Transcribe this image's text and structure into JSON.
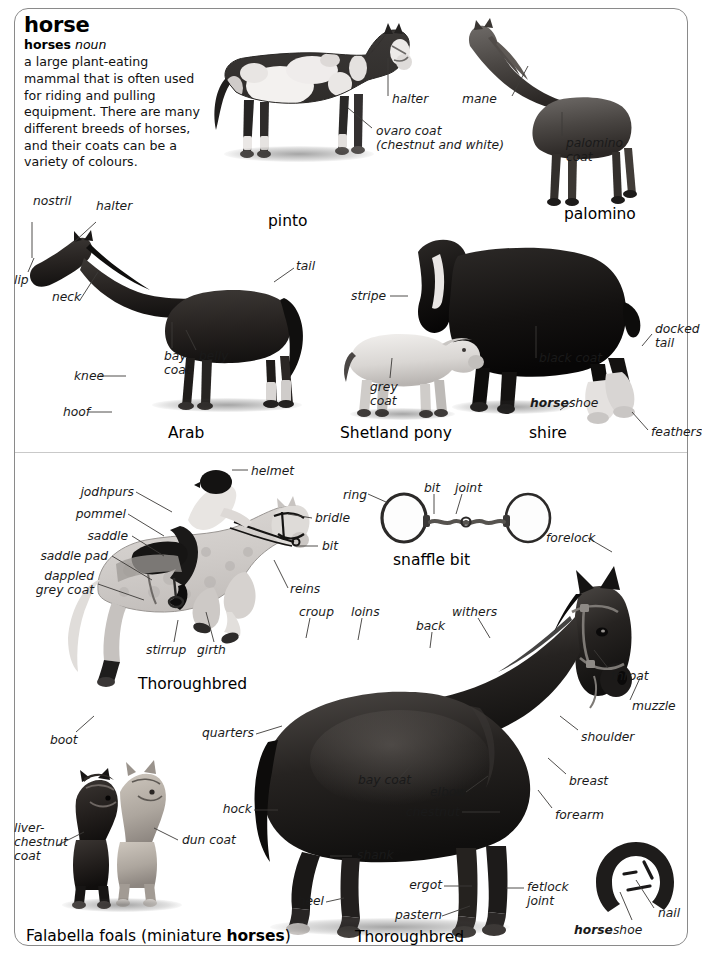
{
  "page": {
    "width": 702,
    "height": 964,
    "background": "#ffffff",
    "frame_color": "#8a8a8a"
  },
  "entry": {
    "headword": "horse",
    "inflection": "horses",
    "part_of_speech": "noun",
    "definition": "a large plant-eating mammal that is often used for riding and pulling equipment. There are many different breeds of horses, and their coats can be a variety of colours."
  },
  "captions": [
    {
      "id": "pinto",
      "text": "pinto"
    },
    {
      "id": "palomino",
      "text": "palomino"
    },
    {
      "id": "arab",
      "text": "Arab"
    },
    {
      "id": "shetland",
      "text": "Shetland pony"
    },
    {
      "id": "shire",
      "text": "shire"
    },
    {
      "id": "thoroughbred-1",
      "text": "Thoroughbred"
    },
    {
      "id": "snaffle-bit",
      "text": "snaffle bit"
    },
    {
      "id": "thoroughbred-2",
      "text": "Thoroughbred"
    },
    {
      "id": "falabella",
      "text": "Falabella foals (miniature horses)"
    }
  ],
  "labels": {
    "pinto": [
      {
        "id": "halter",
        "text": "halter"
      },
      {
        "id": "ovaro-coat",
        "text": "ovaro coat\n(chestnut and white)"
      }
    ],
    "palomino": [
      {
        "id": "mane",
        "text": "mane"
      },
      {
        "id": "palomino-coat",
        "text": "palomino\ncoat"
      }
    ],
    "arab": [
      {
        "id": "nostril",
        "text": "nostril"
      },
      {
        "id": "halter",
        "text": "halter"
      },
      {
        "id": "lip",
        "text": "lip"
      },
      {
        "id": "neck",
        "text": "neck"
      },
      {
        "id": "tail",
        "text": "tail"
      },
      {
        "id": "bay-coat",
        "text": "bay\ncoat"
      },
      {
        "id": "belly",
        "text": "belly"
      },
      {
        "id": "knee",
        "text": "knee"
      },
      {
        "id": "hoof",
        "text": "hoof"
      }
    ],
    "shetland_shire": [
      {
        "id": "stripe",
        "text": "stripe"
      },
      {
        "id": "grey-coat",
        "text": "grey\ncoat"
      },
      {
        "id": "black-coat",
        "text": "black coat"
      },
      {
        "id": "horseshoe",
        "text": "horseshoe",
        "bold_prefix": "horse",
        "rest": "shoe"
      },
      {
        "id": "docked-tail",
        "text": "docked\ntail"
      },
      {
        "id": "feathers",
        "text": "feathers"
      }
    ],
    "thoroughbred_jumper": [
      {
        "id": "helmet",
        "text": "helmet"
      },
      {
        "id": "jodhpurs",
        "text": "jodhpurs"
      },
      {
        "id": "pommel",
        "text": "pommel"
      },
      {
        "id": "saddle",
        "text": "saddle"
      },
      {
        "id": "saddle-pad",
        "text": "saddle pad"
      },
      {
        "id": "dappled-grey-coat",
        "text": "dappled\ngrey coat"
      },
      {
        "id": "bridle",
        "text": "bridle"
      },
      {
        "id": "bit",
        "text": "bit"
      },
      {
        "id": "reins",
        "text": "reins"
      },
      {
        "id": "stirrup",
        "text": "stirrup"
      },
      {
        "id": "girth",
        "text": "girth"
      },
      {
        "id": "boot",
        "text": "boot"
      }
    ],
    "snaffle_bit": [
      {
        "id": "ring",
        "text": "ring"
      },
      {
        "id": "bit",
        "text": "bit"
      },
      {
        "id": "joint",
        "text": "joint"
      }
    ],
    "thoroughbred_main": [
      {
        "id": "forelock",
        "text": "forelock"
      },
      {
        "id": "croup",
        "text": "croup"
      },
      {
        "id": "loins",
        "text": "loins"
      },
      {
        "id": "back",
        "text": "back"
      },
      {
        "id": "withers",
        "text": "withers"
      },
      {
        "id": "throat",
        "text": "throat"
      },
      {
        "id": "muzzle",
        "text": "muzzle"
      },
      {
        "id": "shoulder",
        "text": "shoulder"
      },
      {
        "id": "breast",
        "text": "breast"
      },
      {
        "id": "forearm",
        "text": "forearm"
      },
      {
        "id": "quarters",
        "text": "quarters"
      },
      {
        "id": "bay-coat",
        "text": "bay coat"
      },
      {
        "id": "elbow",
        "text": "elbow"
      },
      {
        "id": "chestnut",
        "text": "chestnut"
      },
      {
        "id": "hock",
        "text": "hock"
      },
      {
        "id": "shank",
        "text": "shank"
      },
      {
        "id": "heel",
        "text": "heel"
      },
      {
        "id": "ergot",
        "text": "ergot"
      },
      {
        "id": "pastern",
        "text": "pastern"
      },
      {
        "id": "fetlock-joint",
        "text": "fetlock\njoint"
      }
    ],
    "falabella": [
      {
        "id": "liver-chestnut-coat",
        "text": "liver-\nchestnut\ncoat"
      },
      {
        "id": "dun-coat",
        "text": "dun coat"
      }
    ],
    "horseshoe_detail": [
      {
        "id": "horseshoe",
        "text": "horseshoe",
        "bold_prefix": "horse",
        "rest": "shoe"
      },
      {
        "id": "nail",
        "text": "nail"
      }
    ]
  }
}
